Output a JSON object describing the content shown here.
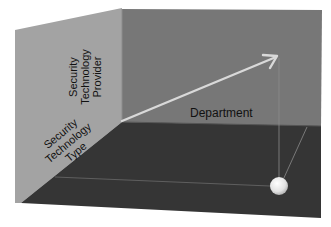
{
  "diagram": {
    "type": "3d-axis-cube",
    "colors": {
      "left_wall": "#a3a3a3",
      "back_wall": "#777777",
      "floor": "#353535",
      "arrow": "#d9d9d9",
      "guide_lines": "#8a8a8a",
      "point": "#e6e6e6"
    },
    "labels": {
      "vertical_axis": [
        "Security",
        "Technology",
        "Provider"
      ],
      "depth_axis": [
        "Security",
        "Technology",
        "Type"
      ],
      "horizontal_axis": "Department"
    }
  }
}
